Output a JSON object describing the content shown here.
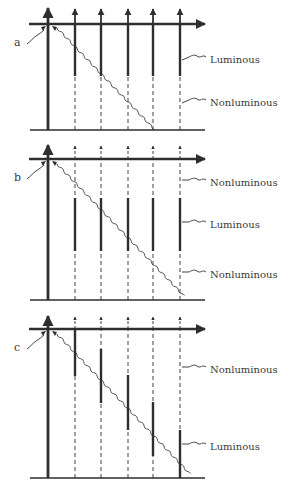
{
  "colors": {
    "ink": "#2e2e2e",
    "label": "#3a3a3a",
    "background": "#ffffff"
  },
  "labels": {
    "luminous": "Luminous",
    "nonluminous": "Nonluminous"
  },
  "panels": [
    {
      "id": "a",
      "letter": "a",
      "axis_y": 24,
      "base_y": 130,
      "arrow_tip_y": 6,
      "columns_x": [
        75,
        101,
        128,
        153,
        180
      ],
      "luminous_segments": [
        [
          24,
          76
        ],
        [
          24,
          76
        ],
        [
          24,
          76
        ],
        [
          24,
          76
        ],
        [
          24,
          76
        ]
      ],
      "wave": {
        "x1": 57,
        "y1": 28,
        "x2": 155,
        "y2": 130
      },
      "callouts": [
        {
          "label_key": "luminous",
          "text": "Luminous",
          "x": 210,
          "y": 60,
          "target_x": 182,
          "target_y": 60
        },
        {
          "label_key": "nonluminous",
          "text": "Nonluminous",
          "x": 210,
          "y": 103,
          "target_x": 182,
          "target_y": 103
        }
      ]
    },
    {
      "id": "b",
      "letter": "b",
      "axis_y": 159,
      "base_y": 300,
      "arrow_tip_y": 143,
      "columns_x": [
        75,
        101,
        128,
        153,
        180
      ],
      "luminous_segments": [
        [
          198,
          251
        ],
        [
          198,
          251
        ],
        [
          198,
          251
        ],
        [
          198,
          251
        ],
        [
          198,
          251
        ]
      ],
      "wave": {
        "x1": 57,
        "y1": 164,
        "x2": 184,
        "y2": 296
      },
      "callouts": [
        {
          "label_key": "nonluminous",
          "text": "Nonluminous",
          "x": 210,
          "y": 183,
          "target_x": 182,
          "target_y": 180
        },
        {
          "label_key": "luminous",
          "text": "Luminous",
          "x": 210,
          "y": 225,
          "target_x": 182,
          "target_y": 222
        },
        {
          "label_key": "nonluminous",
          "text": "Nonluminous",
          "x": 210,
          "y": 275,
          "target_x": 182,
          "target_y": 272
        }
      ]
    },
    {
      "id": "c",
      "letter": "c",
      "axis_y": 329,
      "base_y": 478,
      "arrow_tip_y": 314,
      "columns_x": [
        75,
        101,
        128,
        153,
        180
      ],
      "luminous_segments": [
        [
          329,
          376
        ],
        [
          349,
          403
        ],
        [
          375,
          430
        ],
        [
          402,
          456
        ],
        [
          430,
          478
        ]
      ],
      "wave": {
        "x1": 57,
        "y1": 334,
        "x2": 190,
        "y2": 474
      },
      "callouts": [
        {
          "label_key": "nonluminous",
          "text": "Nonluminous",
          "x": 210,
          "y": 370,
          "target_x": 182,
          "target_y": 367
        },
        {
          "label_key": "luminous",
          "text": "Luminous",
          "x": 210,
          "y": 447,
          "target_x": 182,
          "target_y": 444
        }
      ]
    }
  ]
}
